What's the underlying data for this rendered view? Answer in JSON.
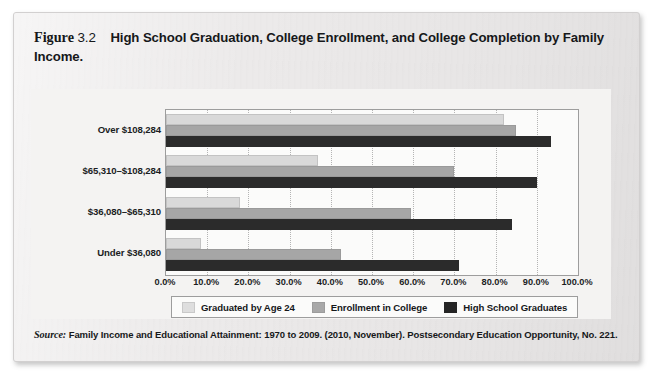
{
  "figure": {
    "label_word": "Figure",
    "number": "3.2",
    "title": "High School Graduation, College Enrollment, and College Completion by Family Income.",
    "source_label": "Source:",
    "source_text": "Family Income and Educational Attainment: 1970 to 2009. (2010, November). Postsecondary Education Opportunity, No. 221."
  },
  "colors": {
    "series_graduated": "#d9d9d9",
    "series_enrollment": "#a6a6a6",
    "series_hs_graduates": "#2b2b2b",
    "card_background": "#eceaea",
    "plot_background": "#fbfbfa",
    "axis_line": "#9d9d9d",
    "gridline": "#b4b4b4",
    "text": "#16181a"
  },
  "chart_data": {
    "type": "bar",
    "orientation": "horizontal",
    "title": "High School Graduation, College Enrollment, and College Completion by Family Income",
    "xlabel": "",
    "ylabel": "",
    "categories": [
      "Over $108,284",
      "$65,310–$108,284",
      "$36,080–$65,310",
      "Under $36,080"
    ],
    "series": [
      {
        "name": "Graduated by Age 24",
        "color": "#d9d9d9",
        "values": [
          82.0,
          37.0,
          18.0,
          8.5
        ]
      },
      {
        "name": "Enrollment in College",
        "color": "#a6a6a6",
        "values": [
          85.0,
          70.0,
          59.5,
          42.5
        ]
      },
      {
        "name": "High School Graduates",
        "color": "#2b2b2b",
        "values": [
          93.5,
          90.0,
          84.0,
          71.0
        ]
      }
    ],
    "xlim": [
      0,
      100
    ],
    "xticks": [
      0,
      10,
      20,
      30,
      40,
      50,
      60,
      70,
      80,
      90,
      100
    ],
    "xtick_labels": [
      "0.0%",
      "10.0%",
      "20.0%",
      "30.0%",
      "40.0%",
      "50.0%",
      "60.0%",
      "70.0%",
      "80.0%",
      "90.0%",
      "100.0%"
    ],
    "grid": true,
    "grid_axis": "x",
    "legend_position": "bottom",
    "legend": [
      "Graduated by Age 24",
      "Enrollment in College",
      "High School Graduates"
    ]
  }
}
